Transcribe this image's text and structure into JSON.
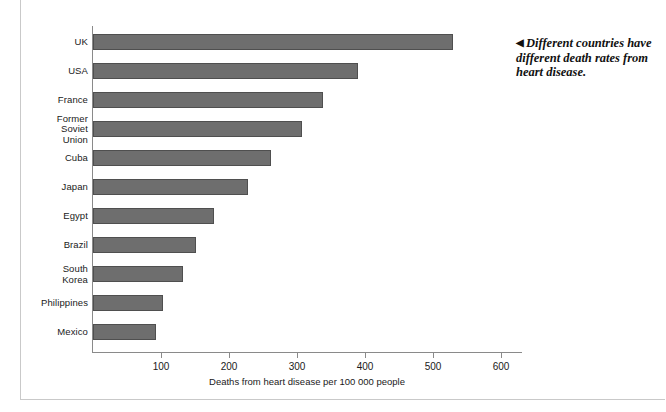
{
  "chart_data": {
    "type": "bar",
    "orientation": "horizontal",
    "title": "",
    "xlabel": "Deaths from heart disease per 100 000 people",
    "ylabel": "",
    "xlim": [
      0,
      630
    ],
    "xticks": [
      100,
      200,
      300,
      400,
      500,
      600
    ],
    "grid": false,
    "legend": null,
    "categories": [
      "UK",
      "USA",
      "France",
      "Former\nSoviet\nUnion",
      "Cuba",
      "Japan",
      "Egypt",
      "Brazil",
      "South\nKorea",
      "Philippines",
      "Mexico"
    ],
    "values": [
      530,
      390,
      338,
      308,
      262,
      228,
      178,
      152,
      132,
      103,
      92
    ],
    "bar_color": "#6e6e6e",
    "bar_edge_color": "#4f4f4f",
    "axis_color": "#8a8a8a"
  },
  "chart": {
    "bars": [
      {
        "label": "UK",
        "label_lines": [
          "UK"
        ],
        "value": 530
      },
      {
        "label": "USA",
        "label_lines": [
          "USA"
        ],
        "value": 390
      },
      {
        "label": "France",
        "label_lines": [
          "France"
        ],
        "value": 338
      },
      {
        "label": "Former Soviet Union",
        "label_lines": [
          "Former",
          "Soviet",
          "Union"
        ],
        "value": 308
      },
      {
        "label": "Cuba",
        "label_lines": [
          "Cuba"
        ],
        "value": 262
      },
      {
        "label": "Japan",
        "label_lines": [
          "Japan"
        ],
        "value": 228
      },
      {
        "label": "Egypt",
        "label_lines": [
          "Egypt"
        ],
        "value": 178
      },
      {
        "label": "Brazil",
        "label_lines": [
          "Brazil"
        ],
        "value": 152
      },
      {
        "label": "South Korea",
        "label_lines": [
          "South",
          "Korea"
        ],
        "value": 132
      },
      {
        "label": "Philippines",
        "label_lines": [
          "Philippines"
        ],
        "value": 103
      },
      {
        "label": "Mexico",
        "label_lines": [
          "Mexico"
        ],
        "value": 92
      }
    ],
    "x_tick_labels": [
      "100",
      "200",
      "300",
      "400",
      "500",
      "600"
    ],
    "x_axis_title": "Deaths from heart disease per 100 000 people"
  },
  "caption": {
    "arrow_glyph": "◀",
    "text": "Different countries have different death rates from heart disease."
  }
}
